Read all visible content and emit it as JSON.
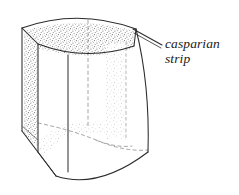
{
  "figure": {
    "name": "casparian-strip-cell-diagram",
    "style": "hand-drawn line art, stippled shading",
    "background_color": "#ffffff",
    "ink_color": "#2b2b2b",
    "stipple_color": "#8a8a8a",
    "hidden_line_color": "#9a9a9a",
    "label": {
      "line1": "casparian",
      "line2": "strip",
      "x": 165,
      "y": 48,
      "line_height": 15,
      "font_style": "italic"
    },
    "leader_line": {
      "name": "label-leader-line",
      "from_x": 162,
      "from_y": 45,
      "to_x": 133,
      "to_y": 29
    },
    "shape": {
      "type": "barrel-prism-cell",
      "top_rim_left": [
        22,
        28
      ],
      "top_rim_apex": [
        80,
        11
      ],
      "top_rim_right": [
        136,
        29
      ],
      "bottom_front_dip": [
        96,
        182
      ],
      "left_silhouette_bottom": [
        22,
        131
      ],
      "right_silhouette_bottom": [
        150,
        150
      ]
    },
    "strip_bands": [
      {
        "name": "top-face-band",
        "visible": true,
        "density": "high"
      },
      {
        "name": "left-front-vertical-band",
        "visible": true,
        "density": "high"
      },
      {
        "name": "right-back-vertical-band",
        "visible": false,
        "density": "low"
      },
      {
        "name": "lower-face-band",
        "visible": true,
        "density": "low"
      }
    ],
    "hidden_edges": [
      {
        "name": "center-vertical-dashed-edge"
      },
      {
        "name": "back-bottom-dashed-rim"
      },
      {
        "name": "inner-bottom-dashed-arc"
      }
    ]
  }
}
